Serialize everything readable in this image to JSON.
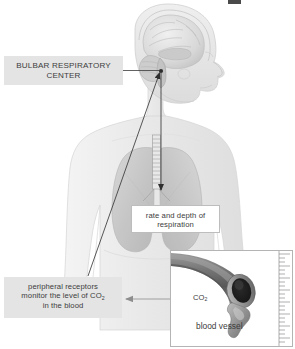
{
  "diagram": {
    "type": "anatomical-flow-diagram"
  },
  "labels": {
    "bulbar": {
      "text": "BULBAR RESPIRATORY CENTER",
      "line1": "BULBAR RESPIRATORY",
      "line2": "CENTER",
      "style": "gray-box-uppercase"
    },
    "rate": {
      "text": "rate and depth of respiration",
      "line1": "rate and depth of",
      "line2": "respiration",
      "style": "white-box"
    },
    "peripheral": {
      "line1": "peripheral receptors",
      "line2_pre": "monitor the level of CO",
      "line2_sub": "2",
      "line3": "in the blood",
      "style": "gray-box"
    }
  },
  "inset": {
    "co2_pre": "CO",
    "co2_sub": "2",
    "vessel_label": "blood vessel",
    "has_ruler": true,
    "ruler_position": "right-edge"
  },
  "anatomy": {
    "head": "lateral head profile with brain cross-section",
    "brain_parts": [
      "cerebrum",
      "cerebellum",
      "brainstem",
      "corpus callosum"
    ],
    "torso": "upper body with lungs and trachea",
    "trachea": "ringed cartilage tube",
    "lungs": "left and right lung lobes"
  },
  "arrows": {
    "leader_to_brainstem": "horizontal leader from BULBAR RESPIRATORY CENTER box to brainstem point",
    "brainstem_to_trachea": "vertical arrow down trachea to lungs",
    "receptors_to_brainstem": "long diagonal arrow from peripheral receptors up to brainstem",
    "inset_to_receptors": "horizontal arrow left from blood vessel inset to peripheral receptors"
  },
  "colors": {
    "label_gray": "#e4e4e4",
    "text": "#3d3d3d",
    "body_fill": "#ededed",
    "body_stroke": "#d2d2d2",
    "lung_fill": "#c9c9c9",
    "brain_fill": "#dcdcdc",
    "arrow": "#434343",
    "inset_border": "#b4b4b4",
    "vessel_dark": "#5a5a5a",
    "background": "#ffffff"
  }
}
